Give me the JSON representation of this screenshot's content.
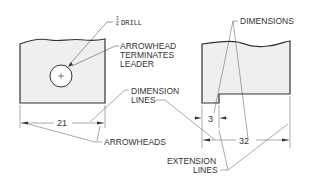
{
  "diagram": {
    "type": "dimensioning-terminology",
    "labels": {
      "drill_fraction_num": "3",
      "drill_fraction_den": "4",
      "drill": "DRILL",
      "arrowhead_line1": "ARROWHEAD",
      "arrowhead_line2": "TERMINATES",
      "arrowhead_line3": "LEADER",
      "dimension_lines_line1": "DIMENSION",
      "dimension_lines_line2": "LINES",
      "arrowheads": "ARROWHEADS",
      "dimensions": "DIMENSIONS",
      "extension_lines_line1": "EXTENSION",
      "extension_lines_line2": "LINES"
    },
    "values": {
      "left_width": "21",
      "step_width": "3",
      "right_width": "32"
    },
    "colors": {
      "part_fill": "#efefef",
      "outline": "#333333",
      "thin_line": "#555555"
    }
  }
}
